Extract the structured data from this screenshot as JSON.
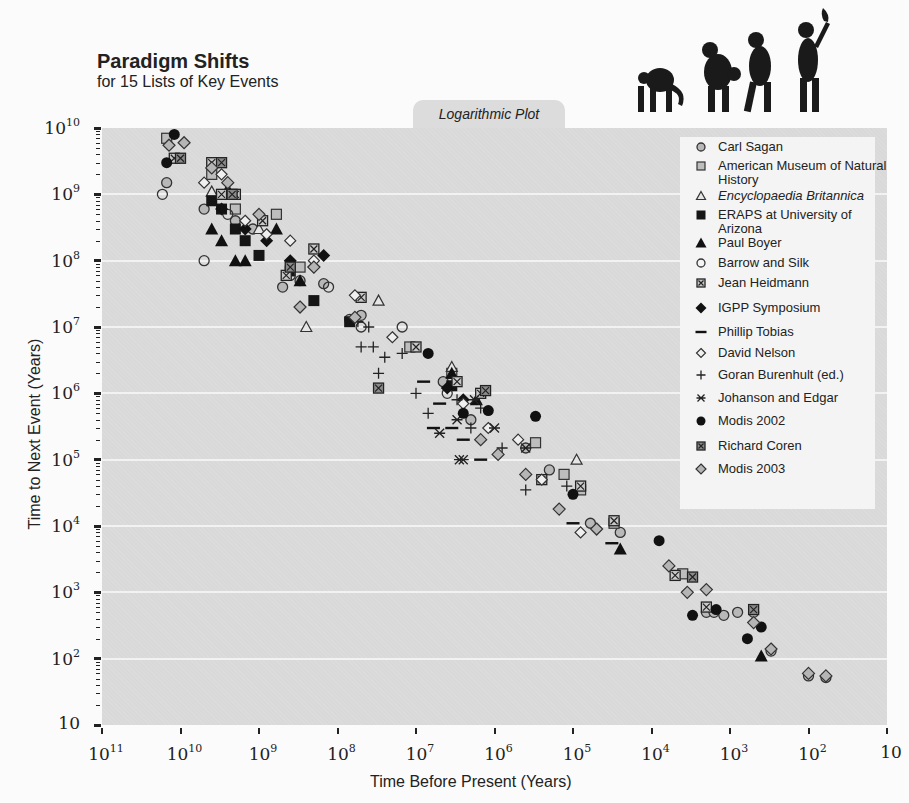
{
  "header": {
    "title": "Paradigm Shifts",
    "subtitle": "for 15 Lists of Key Events",
    "plot_tab": "Logarithmic Plot",
    "illustration": "march-of-progress-silhouettes"
  },
  "axes": {
    "y_label": "Time to Next  Event (Years)",
    "x_label": "Time Before Present (Years)",
    "y_ticks": [
      {
        "base": "10",
        "exp": "10"
      },
      {
        "base": "10",
        "exp": "9"
      },
      {
        "base": "10",
        "exp": "8"
      },
      {
        "base": "10",
        "exp": "7"
      },
      {
        "base": "10",
        "exp": "6"
      },
      {
        "base": "10",
        "exp": "5"
      },
      {
        "base": "10",
        "exp": "4"
      },
      {
        "base": "10",
        "exp": "3"
      },
      {
        "base": "10",
        "exp": "2"
      },
      {
        "base": "10",
        "exp": ""
      }
    ],
    "x_ticks": [
      {
        "base": "10",
        "exp": "11"
      },
      {
        "base": "10",
        "exp": "10"
      },
      {
        "base": "10",
        "exp": "9"
      },
      {
        "base": "10",
        "exp": "8"
      },
      {
        "base": "10",
        "exp": "7"
      },
      {
        "base": "10",
        "exp": "6"
      },
      {
        "base": "10",
        "exp": "5"
      },
      {
        "base": "10",
        "exp": "4"
      },
      {
        "base": "10",
        "exp": "3"
      },
      {
        "base": "10",
        "exp": "2"
      },
      {
        "base": "10",
        "exp": ""
      }
    ]
  },
  "legend": {
    "items": [
      {
        "label": "Carl Sagan",
        "marker": "circle-gray"
      },
      {
        "label": "American Museum of Natural History",
        "marker": "square-gray"
      },
      {
        "label": "Encyclopaedia Britannica",
        "marker": "triangle-open",
        "italic": true
      },
      {
        "label": "ERAPS at University of Arizona",
        "marker": "square-black"
      },
      {
        "label": "Paul Boyer",
        "marker": "triangle-black"
      },
      {
        "label": "Barrow and Silk",
        "marker": "circle-open"
      },
      {
        "label": "Jean Heidmann",
        "marker": "square-x"
      },
      {
        "label": "IGPP Symposium",
        "marker": "diamond-black"
      },
      {
        "label": "Phillip Tobias",
        "marker": "dash"
      },
      {
        "label": "David Nelson",
        "marker": "diamond-open"
      },
      {
        "label": "Goran Burenhult (ed.)",
        "marker": "plus"
      },
      {
        "label": "Johanson and Edgar",
        "marker": "asterisk"
      },
      {
        "label": "Modis 2002",
        "marker": "circle-black"
      },
      {
        "label": "Richard Coren",
        "marker": "square-x-dark"
      },
      {
        "label": "Modis 2003",
        "marker": "diamond-gray"
      }
    ]
  },
  "chart_data": {
    "type": "scatter",
    "title": "Paradigm Shifts",
    "subtitle": "for 15 Lists of Key Events",
    "annotation": "Logarithmic Plot",
    "xlabel": "Time Before Present (Years)",
    "ylabel": "Time to Next  Event (Years)",
    "x_scale": "log",
    "y_scale": "log",
    "xlim": [
      100000000000.0,
      10
    ],
    "ylim": [
      10,
      10000000000.0
    ],
    "x_reversed": true,
    "grid": "horizontal at each decade",
    "legend_position": "upper right",
    "series": [
      {
        "name": "Carl Sagan",
        "marker": "circle-gray",
        "points": [
          [
            15000000000.0,
            1500000000.0
          ],
          [
            5000000000.0,
            600000000.0
          ],
          [
            2000000000.0,
            400000000.0
          ],
          [
            1200000000.0,
            300000000.0
          ],
          [
            500000000.0,
            40000000.0
          ],
          [
            300000000.0,
            50000000.0
          ],
          [
            150000000.0,
            45000000.0
          ],
          [
            70000000.0,
            13000000.0
          ],
          [
            50000000.0,
            15000000.0
          ],
          [
            4500000.0,
            1500000.0
          ],
          [
            2000000.0,
            400000.0
          ],
          [
            400000.0,
            150000.0
          ],
          [
            200000.0,
            70000.0
          ],
          [
            60000.0,
            11000.0
          ],
          [
            25000.0,
            8000.0
          ],
          [
            2000.0,
            500
          ],
          [
            1600.0,
            500
          ],
          [
            1200.0,
            450
          ],
          [
            800,
            500
          ],
          [
            500,
            500
          ],
          [
            300,
            130
          ],
          [
            100,
            55
          ],
          [
            60,
            52
          ]
        ]
      },
      {
        "name": "American Museum of Natural History",
        "marker": "square-gray",
        "points": [
          [
            15000000000.0,
            7000000000.0
          ],
          [
            4000000000.0,
            2000000000.0
          ],
          [
            2000000000.0,
            600000000.0
          ],
          [
            600000000.0,
            500000000.0
          ],
          [
            300000000.0,
            80000000.0
          ],
          [
            12000000.0,
            5000000.0
          ],
          [
            3500000.0,
            2000000.0
          ],
          [
            300000.0,
            180000.0
          ],
          [
            130000.0,
            60000.0
          ],
          [
            80000.0,
            35000.0
          ],
          [
            30000.0,
            11000.0
          ],
          [
            4000.0,
            1900.0
          ]
        ]
      },
      {
        "name": "Encyclopaedia Britannica",
        "marker": "triangle-open",
        "points": [
          [
            4000000000.0,
            1100000000.0
          ],
          [
            1000000000.0,
            300000000.0
          ],
          [
            250000000.0,
            10000000.0
          ],
          [
            30000000.0,
            25000000.0
          ],
          [
            3500000.0,
            2500000.0
          ],
          [
            90000.0,
            100000.0
          ]
        ]
      },
      {
        "name": "ERAPS at University of Arizona",
        "marker": "square-black",
        "points": [
          [
            4000000000.0,
            800000000.0
          ],
          [
            3000000000.0,
            600000000.0
          ],
          [
            2000000000.0,
            300000000.0
          ],
          [
            1500000000.0,
            200000000.0
          ],
          [
            1000000000.0,
            120000000.0
          ],
          [
            400000000.0,
            70000000.0
          ],
          [
            200000000.0,
            25000000.0
          ],
          [
            70000000.0,
            12000000.0
          ],
          [
            3500000.0,
            1300000.0
          ]
        ]
      },
      {
        "name": "Paul Boyer",
        "marker": "triangle-black",
        "points": [
          [
            4000000000.0,
            300000000.0
          ],
          [
            3000000000.0,
            200000000.0
          ],
          [
            2500000000.0,
            1200000000.0
          ],
          [
            2000000000.0,
            100000000.0
          ],
          [
            1500000000.0,
            100000000.0
          ],
          [
            600000000.0,
            300000000.0
          ],
          [
            300000000.0,
            50000000.0
          ],
          [
            3500000.0,
            2000000.0
          ],
          [
            1700000.0,
            800000.0
          ],
          [
            25000.0,
            4500.0
          ],
          [
            400,
            110
          ]
        ]
      },
      {
        "name": "Barrow and Silk",
        "marker": "circle-open",
        "points": [
          [
            17000000000.0,
            1000000000.0
          ],
          [
            5000000000.0,
            100000000.0
          ],
          [
            2500000000.0,
            500000000.0
          ],
          [
            400000000.0,
            60000000.0
          ],
          [
            130000000.0,
            40000000.0
          ],
          [
            50000000.0,
            10000000.0
          ],
          [
            15000000.0,
            10000000.0
          ],
          [
            4000000.0,
            1000000.0
          ]
        ]
      },
      {
        "name": "Jean Heidmann",
        "marker": "square-x",
        "points": [
          [
            12000000000.0,
            3500000000.0
          ],
          [
            4000000000.0,
            3000000000.0
          ],
          [
            3000000000.0,
            1000000000.0
          ],
          [
            2000000000.0,
            1000000000.0
          ],
          [
            900000000.0,
            400000000.0
          ],
          [
            450000000.0,
            60000000.0
          ],
          [
            200000000.0,
            150000000.0
          ],
          [
            50000000.0,
            28000000.0
          ],
          [
            10000000.0,
            5000000.0
          ],
          [
            3000000.0,
            1500000.0
          ],
          [
            1500000.0,
            1000000.0
          ],
          [
            250000.0,
            50000.0
          ],
          [
            80000.0,
            40000.0
          ],
          [
            30000.0,
            12000.0
          ],
          [
            5000.0,
            1800.0
          ],
          [
            2000.0,
            600
          ]
        ]
      },
      {
        "name": "IGPP Symposium",
        "marker": "diamond-black",
        "points": [
          [
            3000000000.0,
            600000000.0
          ],
          [
            1500000000.0,
            300000000.0
          ],
          [
            800000000.0,
            200000000.0
          ],
          [
            400000000.0,
            100000000.0
          ],
          [
            200000000.0,
            80000000.0
          ],
          [
            150000000.0,
            120000000.0
          ],
          [
            4000000.0,
            1200000.0
          ],
          [
            2500000.0,
            800000.0
          ]
        ]
      },
      {
        "name": "Phillip Tobias",
        "marker": "dash",
        "points": [
          [
            8000000.0,
            1500000.0
          ],
          [
            5000000.0,
            700000.0
          ],
          [
            6000000.0,
            300000.0
          ],
          [
            3500000.0,
            300000.0
          ],
          [
            2500000.0,
            200000.0
          ],
          [
            1500000.0,
            100000.0
          ],
          [
            100000.0,
            11000.0
          ],
          [
            32000.0,
            5500.0
          ]
        ]
      },
      {
        "name": "David Nelson",
        "marker": "diamond-open",
        "points": [
          [
            5000000000.0,
            1500000000.0
          ],
          [
            3000000000.0,
            2000000000.0
          ],
          [
            1500000000.0,
            400000000.0
          ],
          [
            800000000.0,
            250000000.0
          ],
          [
            400000000.0,
            200000000.0
          ],
          [
            200000000.0,
            100000000.0
          ],
          [
            60000000.0,
            30000000.0
          ],
          [
            20000000.0,
            7000000.0
          ],
          [
            2500000.0,
            700000.0
          ],
          [
            1200000.0,
            300000.0
          ],
          [
            500000.0,
            200000.0
          ],
          [
            250000.0,
            50000.0
          ],
          [
            80000.0,
            8000.0
          ]
        ]
      },
      {
        "name": "Goran Burenhult (ed.)",
        "marker": "plus",
        "points": [
          [
            55000000.0,
            12000000.0
          ],
          [
            40000000.0,
            10000000.0
          ],
          [
            50000000.0,
            5000000.0
          ],
          [
            35000000.0,
            5000000.0
          ],
          [
            25000000.0,
            3500000.0
          ],
          [
            15000000.0,
            4000000.0
          ],
          [
            30000000.0,
            2000000.0
          ],
          [
            10000000.0,
            1000000.0
          ],
          [
            7000000.0,
            500000.0
          ],
          [
            3000000.0,
            800000.0
          ],
          [
            1500000.0,
            600000.0
          ],
          [
            2000000.0,
            300000.0
          ],
          [
            800000.0,
            150000.0
          ],
          [
            120000.0,
            40000.0
          ],
          [
            400000.0,
            35000.0
          ]
        ]
      },
      {
        "name": "Johanson and Edgar",
        "marker": "asterisk",
        "points": [
          [
            5000000.0,
            250000.0
          ],
          [
            3000000.0,
            400000.0
          ],
          [
            2800000.0,
            100000.0
          ],
          [
            2500000.0,
            100000.0
          ],
          [
            1800000.0,
            800000.0
          ],
          [
            1000000.0,
            300000.0
          ],
          [
            400000.0,
            150000.0
          ]
        ]
      },
      {
        "name": "Modis 2002",
        "marker": "circle-black",
        "points": [
          [
            12000000000.0,
            8000000000.0
          ],
          [
            15000000000.0,
            3000000000.0
          ],
          [
            7000000.0,
            4000000.0
          ],
          [
            2500000.0,
            500000.0
          ],
          [
            1200000.0,
            550000.0
          ],
          [
            300000.0,
            450000.0
          ],
          [
            100000.0,
            30000.0
          ],
          [
            8000.0,
            6000.0
          ],
          [
            3000.0,
            450
          ],
          [
            1500.0,
            550
          ],
          [
            600,
            200
          ],
          [
            400,
            300
          ]
        ]
      },
      {
        "name": "Richard Coren",
        "marker": "square-x-dark",
        "points": [
          [
            10000000000.0,
            3500000000.0
          ],
          [
            3000000000.0,
            3000000000.0
          ],
          [
            2200000000.0,
            1000000000.0
          ],
          [
            400000000.0,
            80000000.0
          ],
          [
            30000000.0,
            1200000.0
          ],
          [
            1300000.0,
            1100000.0
          ],
          [
            3000.0,
            1700.0
          ],
          [
            500,
            550
          ]
        ]
      },
      {
        "name": "Modis 2003",
        "marker": "diamond-gray",
        "points": [
          [
            14000000000.0,
            5500000000.0
          ],
          [
            9000000000.0,
            6000000000.0
          ],
          [
            4000000000.0,
            2500000000.0
          ],
          [
            2500000000.0,
            1500000000.0
          ],
          [
            1000000000.0,
            500000000.0
          ],
          [
            300000000.0,
            20000000.0
          ],
          [
            200000000.0,
            80000000.0
          ],
          [
            60000000.0,
            14000000.0
          ],
          [
            1500000.0,
            200000.0
          ],
          [
            900000.0,
            120000.0
          ],
          [
            400000.0,
            60000.0
          ],
          [
            150000.0,
            18000.0
          ],
          [
            50000.0,
            9000.0
          ],
          [
            6000.0,
            2500.0
          ],
          [
            3500.0,
            1000.0
          ],
          [
            2000.0,
            1100.0
          ],
          [
            500,
            350
          ],
          [
            300,
            140
          ],
          [
            100,
            60
          ],
          [
            60,
            55
          ]
        ]
      }
    ]
  }
}
